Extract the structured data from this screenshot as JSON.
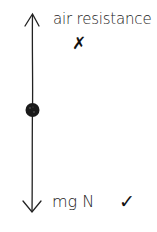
{
  "diagram": {
    "type": "free-body-diagram",
    "object": "particle",
    "forces": [
      {
        "direction": "up",
        "label": "air resistance",
        "mark": "✗",
        "mark_meaning": "incorrect"
      },
      {
        "direction": "down",
        "label": "mg N",
        "mark": "✓",
        "mark_meaning": "correct"
      }
    ],
    "colors": {
      "ink": "#111111",
      "background": "#ffffff"
    }
  }
}
